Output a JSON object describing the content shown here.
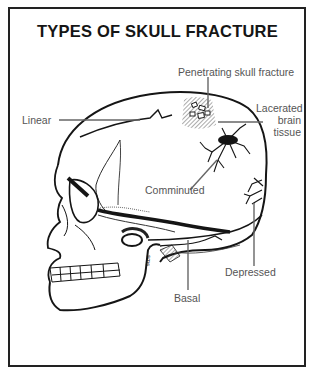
{
  "caption_fragment": "FIGURE 8-5",
  "title": "TYPES OF SKULL FRACTURE",
  "labels": {
    "penetrating": "Penetrating skull fracture",
    "lacerated_line1": "Lacerated",
    "lacerated_line2": "brain",
    "lacerated_line3": "tissue",
    "linear": "Linear",
    "comminuted": "Comminuted",
    "depressed": "Depressed",
    "basal": "Basal"
  },
  "signature": "sms",
  "colors": {
    "ink": "#151515",
    "label_text": "#555555",
    "leader_line": "#666666",
    "background": "#ffffff"
  }
}
